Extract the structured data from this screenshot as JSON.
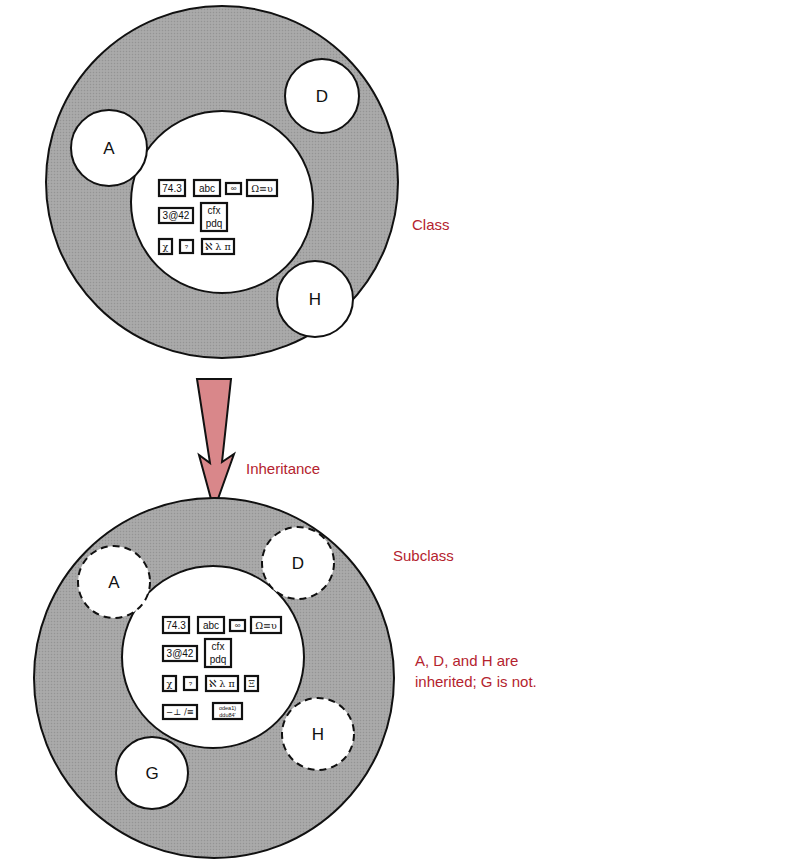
{
  "labels": {
    "class": "Class",
    "inheritance": "Inheritance",
    "subclass": "Subclass",
    "caption_line1": "A, D, and H are",
    "caption_line2": "inherited; G is not."
  },
  "class_circle": {
    "members": {
      "a": "A",
      "d": "D",
      "h": "H"
    },
    "data_items": {
      "item1": "74.3",
      "item2": "abc",
      "item3": "∞",
      "item4": "Ω≡υ",
      "item5": "3@42",
      "item6_line1": "cfx",
      "item6_line2": "pdq",
      "item7": "χ",
      "item8": "?",
      "item9": "ℵ λ π"
    }
  },
  "subclass_circle": {
    "members": {
      "a": "A",
      "d": "D",
      "h": "H",
      "g": "G"
    },
    "data_items": {
      "item1": "74.3",
      "item2": "abc",
      "item3": "∞",
      "item4": "Ω≡υ",
      "item5": "3@42",
      "item6_line1": "cfx",
      "item6_line2": "pdq",
      "item7": "χ",
      "item8": "?",
      "item9": "ℵ λ π",
      "item10": "Ξ",
      "item11": "−⊥ /≡",
      "item12_line1": "odea1)",
      "item12_line2": "ddu84'"
    }
  },
  "colors": {
    "outer_fill": "#a9a9a9",
    "arrow_fill": "#d9878a",
    "label_red": "#b4232e",
    "stroke": "#111111"
  }
}
